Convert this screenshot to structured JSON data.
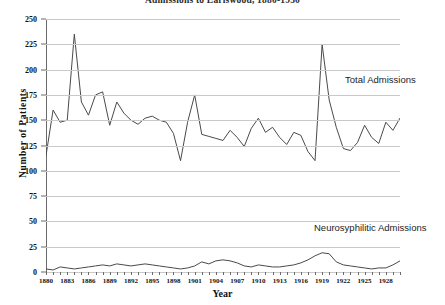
{
  "chart_data": {
    "type": "line",
    "title": "Admissions to Earlswood, 1880-1930",
    "xlabel": "Year",
    "ylabel": "Number of Patients",
    "ylim": [
      0,
      250
    ],
    "ytick_step": 25,
    "yticks": [
      0,
      25,
      50,
      75,
      100,
      125,
      150,
      175,
      200,
      225,
      250
    ],
    "xlim": [
      1880,
      1930
    ],
    "xticks": [
      1880,
      1883,
      1886,
      1889,
      1892,
      1895,
      1898,
      1901,
      1904,
      1907,
      1910,
      1913,
      1916,
      1919,
      1922,
      1925,
      1928
    ],
    "grid": true,
    "legend_position": "inline-annotation",
    "x": [
      1880,
      1881,
      1882,
      1883,
      1884,
      1885,
      1886,
      1887,
      1888,
      1889,
      1890,
      1891,
      1892,
      1893,
      1894,
      1895,
      1896,
      1897,
      1898,
      1899,
      1900,
      1901,
      1902,
      1903,
      1904,
      1905,
      1906,
      1907,
      1908,
      1909,
      1910,
      1911,
      1912,
      1913,
      1914,
      1915,
      1916,
      1917,
      1918,
      1919,
      1920,
      1921,
      1922,
      1923,
      1924,
      1925,
      1926,
      1927,
      1928,
      1929,
      1930
    ],
    "series": [
      {
        "name": "Total Admissions",
        "color": "#4a4a4a",
        "values": [
          115,
          160,
          148,
          150,
          235,
          168,
          155,
          175,
          178,
          145,
          168,
          157,
          150,
          146,
          152,
          154,
          150,
          148,
          137,
          110,
          148,
          175,
          136,
          134,
          132,
          130,
          140,
          133,
          124,
          142,
          152,
          138,
          143,
          133,
          126,
          138,
          135,
          119,
          110,
          225,
          170,
          143,
          122,
          120,
          128,
          145,
          133,
          127,
          148,
          140,
          152
        ]
      },
      {
        "name": "Neurosyphilitic Admissions",
        "color": "#4a4a4a",
        "values": [
          3,
          2,
          5,
          4,
          3,
          4,
          5,
          6,
          7,
          6,
          8,
          7,
          6,
          7,
          8,
          7,
          6,
          5,
          4,
          3,
          4,
          6,
          10,
          8,
          11,
          12,
          11,
          9,
          6,
          5,
          7,
          6,
          5,
          5,
          6,
          7,
          9,
          12,
          16,
          19,
          18,
          10,
          7,
          6,
          5,
          4,
          3,
          4,
          4,
          7,
          11
        ]
      }
    ],
    "annotations": [
      {
        "id": "total",
        "text": "Total Admissions"
      },
      {
        "id": "neuro",
        "text": "Neurosyphilitic Admissions"
      }
    ]
  }
}
